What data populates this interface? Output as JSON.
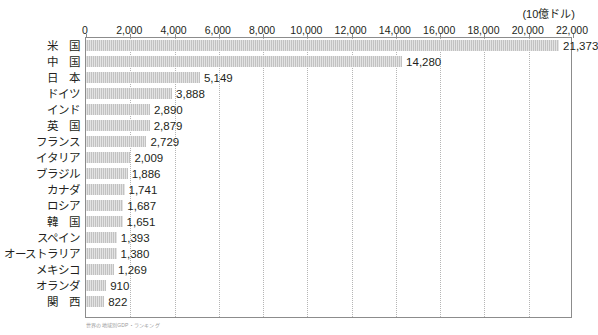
{
  "unit_label": "(10億ドル)",
  "source_note": "世界の地域別GDP・ランキング",
  "chart_data": {
    "type": "bar",
    "orientation": "horizontal",
    "title": "",
    "subtitle": "",
    "xlabel": "(10億ドル)",
    "ylabel": "",
    "xlim": [
      0,
      22000
    ],
    "xtick_interval": 2000,
    "grid": true,
    "grid_style": "dotted-vertical",
    "legend": "none",
    "bar_color": "#c2c2c2",
    "categories": [
      "米　国",
      "中　国",
      "日　本",
      "ドイツ",
      "インド",
      "英　国",
      "フランス",
      "イタリア",
      "ブラジル",
      "カナダ",
      "ロシア",
      "韓　国",
      "スペイン",
      "オーストラリア",
      "メキシコ",
      "オランダ",
      "関　西"
    ],
    "values": [
      21373,
      14280,
      5149,
      3888,
      2890,
      2879,
      2729,
      2009,
      1886,
      1741,
      1687,
      1651,
      1393,
      1380,
      1269,
      910,
      822
    ],
    "value_labels": [
      "21,373",
      "14,280",
      "5,149",
      "3,888",
      "2,890",
      "2,879",
      "2,729",
      "2,009",
      "1,886",
      "1,741",
      "1,687",
      "1,651",
      "1,393",
      "1,380",
      "1,269",
      "910",
      "822"
    ],
    "xtick_labels": [
      "0",
      "2,000",
      "4,000",
      "6,000",
      "8,000",
      "10,000",
      "12,000",
      "14,000",
      "16,000",
      "18,000",
      "20,000",
      "22,000"
    ],
    "xtick_values": [
      0,
      2000,
      4000,
      6000,
      8000,
      10000,
      12000,
      14000,
      16000,
      18000,
      20000,
      22000
    ]
  }
}
